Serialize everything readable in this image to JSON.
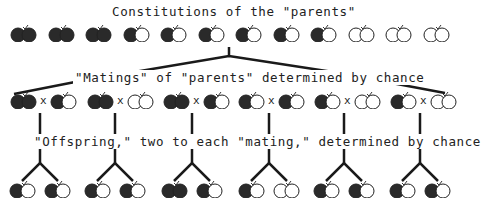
{
  "title": "Constitutions of the \"parents\"",
  "matings_label": "\"Matings\" of \"parents\" determined by chance",
  "offspring_label": "\"Offspring,\" two to each \"mating,\" determined by chance",
  "cross_symbol": "x",
  "legend": {
    "B": "dark (black) gene",
    "w": "white gene"
  },
  "colors": {
    "dark": "#2a2a2a",
    "light": "#ffffff",
    "line": "#1a1a1a"
  },
  "parents": [
    "BB",
    "BB",
    "BB",
    "Bw",
    "Bw",
    "Bw",
    "Bw",
    "Bw",
    "Bw",
    "ww",
    "ww",
    "ww"
  ],
  "matings": [
    {
      "a": "BB",
      "b": "Bw"
    },
    {
      "a": "BB",
      "b": "ww"
    },
    {
      "a": "BB",
      "b": "Bw"
    },
    {
      "a": "Bw",
      "b": "Bw"
    },
    {
      "a": "Bw",
      "b": "ww"
    },
    {
      "a": "Bw",
      "b": "ww"
    }
  ],
  "offspring": [
    [
      "Bw",
      "Bw"
    ],
    [
      "Bw",
      "Bw"
    ],
    [
      "BB",
      "Bw"
    ],
    [
      "Bw",
      "ww"
    ],
    [
      "Bw",
      "Bw"
    ],
    [
      "Bw",
      "Bw"
    ]
  ]
}
